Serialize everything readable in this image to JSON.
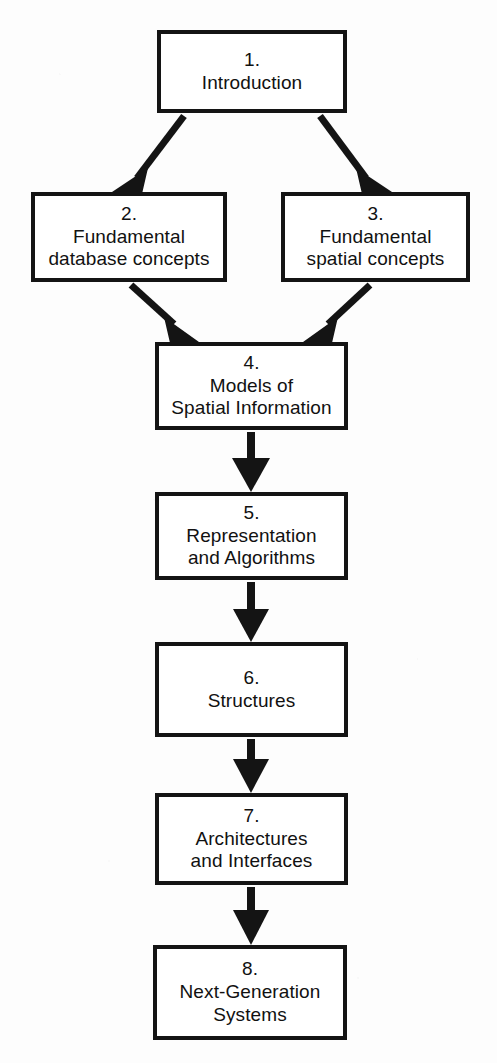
{
  "diagram": {
    "type": "flowchart",
    "colors": {
      "box_border": "#141414",
      "box_fill": "#ffffff",
      "arrow": "#141414",
      "page_background": "#fdfdfd",
      "text": "#111111"
    },
    "nodes": [
      {
        "id": "ch1",
        "number": "1.",
        "lines": [
          "Introduction"
        ],
        "x": 157,
        "y": 30,
        "w": 190,
        "h": 83
      },
      {
        "id": "ch2",
        "number": "2.",
        "lines": [
          "Fundamental",
          "database concepts"
        ],
        "x": 31,
        "y": 192,
        "w": 196,
        "h": 90
      },
      {
        "id": "ch3",
        "number": "3.",
        "lines": [
          "Fundamental",
          "spatial concepts"
        ],
        "x": 281,
        "y": 192,
        "w": 189,
        "h": 90
      },
      {
        "id": "ch4",
        "number": "4.",
        "lines": [
          "Models of",
          "Spatial Information"
        ],
        "x": 155,
        "y": 342,
        "w": 193,
        "h": 88
      },
      {
        "id": "ch5",
        "number": "5.",
        "lines": [
          "Representation",
          "and Algorithms"
        ],
        "x": 155,
        "y": 492,
        "w": 193,
        "h": 88
      },
      {
        "id": "ch6",
        "number": "6.",
        "lines": [
          "Structures"
        ],
        "x": 155,
        "y": 642,
        "w": 193,
        "h": 95
      },
      {
        "id": "ch7",
        "number": "7.",
        "lines": [
          "Architectures",
          "and Interfaces"
        ],
        "x": 155,
        "y": 793,
        "w": 193,
        "h": 92
      },
      {
        "id": "ch8",
        "number": "8.",
        "lines": [
          "Next-Generation",
          "Systems"
        ],
        "x": 153,
        "y": 945,
        "w": 194,
        "h": 95
      }
    ],
    "edges": [
      {
        "from": "ch1",
        "to": "ch2",
        "kind": "diagonal-left"
      },
      {
        "from": "ch1",
        "to": "ch3",
        "kind": "diagonal-right"
      },
      {
        "from": "ch2",
        "to": "ch4",
        "kind": "diagonal-right"
      },
      {
        "from": "ch3",
        "to": "ch4",
        "kind": "diagonal-left"
      },
      {
        "from": "ch4",
        "to": "ch5",
        "kind": "vertical"
      },
      {
        "from": "ch5",
        "to": "ch6",
        "kind": "vertical"
      },
      {
        "from": "ch6",
        "to": "ch7",
        "kind": "vertical"
      },
      {
        "from": "ch7",
        "to": "ch8",
        "kind": "vertical"
      }
    ]
  }
}
